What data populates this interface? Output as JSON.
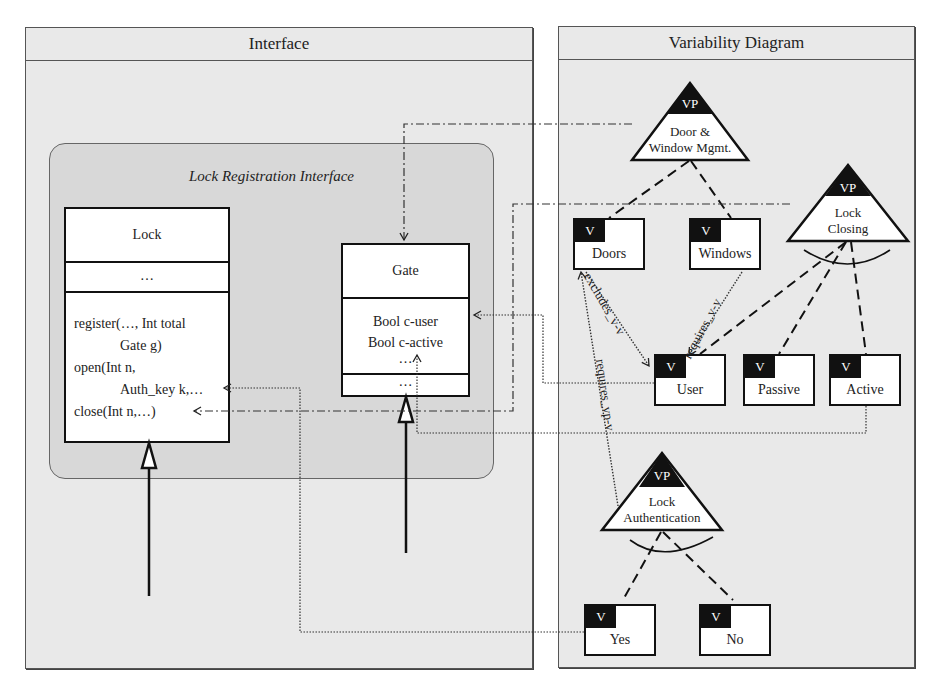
{
  "interface_panel": {
    "title": "Interface",
    "group": {
      "title": "Lock Registration Interface",
      "classes": {
        "lock": {
          "name": "Lock",
          "attributes": "…",
          "operations": [
            {
              "text": "register(…, Int total",
              "indent": false
            },
            {
              "text": "Gate g)",
              "indent": true
            },
            {
              "text": "open(Int n,",
              "indent": false
            },
            {
              "text": "Auth_key k,…",
              "indent": true
            },
            {
              "text": "close(Int n,…)",
              "indent": false
            }
          ]
        },
        "gate": {
          "name": "Gate",
          "attributes": [
            "Bool c-user",
            "Bool c-active",
            "…"
          ],
          "operations": "…"
        }
      }
    }
  },
  "variability_panel": {
    "title": "Variability Diagram",
    "variation_points": [
      {
        "id": "door_window",
        "tag": "VP",
        "label_line1": "Door &",
        "label_line2": "Window Mgmt."
      },
      {
        "id": "lock_closing",
        "tag": "VP",
        "label_line1": "Lock",
        "label_line2": "Closing"
      },
      {
        "id": "lock_auth",
        "tag": "VP",
        "label_line1": "Lock",
        "label_line2": "Authentication"
      }
    ],
    "variants": [
      {
        "id": "doors",
        "tag": "V",
        "label": "Doors"
      },
      {
        "id": "windows",
        "tag": "V",
        "label": "Windows"
      },
      {
        "id": "user",
        "tag": "V",
        "label": "User"
      },
      {
        "id": "passive",
        "tag": "V",
        "label": "Passive"
      },
      {
        "id": "active",
        "tag": "V",
        "label": "Active"
      },
      {
        "id": "yes",
        "tag": "V",
        "label": "Yes"
      },
      {
        "id": "no",
        "tag": "V",
        "label": "No"
      }
    ],
    "constraints": [
      {
        "label": "excludes_v-v",
        "from": "Doors",
        "to": "User"
      },
      {
        "label": "requires_v-v",
        "from": "Windows",
        "to": "User"
      },
      {
        "label": "requires_vp-v",
        "from": "Lock Authentication",
        "to": "Doors"
      }
    ]
  }
}
